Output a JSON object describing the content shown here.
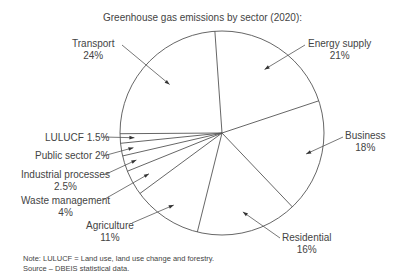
{
  "chart_data": {
    "type": "pie",
    "title": "Greenhouse gas emissions by sector (2020):",
    "categories": [
      "Energy supply",
      "Business",
      "Residential",
      "Agriculture",
      "Waste management",
      "Industrial processes",
      "Public sector",
      "LULUCF",
      "Transport"
    ],
    "values": [
      21,
      18,
      16,
      11,
      4,
      2.5,
      2,
      1.5,
      24
    ],
    "unit": "%",
    "start_angle_deg": -4,
    "direction": "clockwise",
    "legend": "none (callout labels)"
  },
  "labels": [
    {
      "name": "Energy supply",
      "pct": "21%"
    },
    {
      "name": "Business",
      "pct": "18%"
    },
    {
      "name": "Residential",
      "pct": "16%"
    },
    {
      "name": "Agriculture",
      "pct": "11%"
    },
    {
      "name": "Waste management",
      "pct": "4%"
    },
    {
      "name": "Industrial processes",
      "pct": "2.5%"
    },
    {
      "name": "Public sector 2%",
      "pct": ""
    },
    {
      "name": "LULUCF 1.5%",
      "pct": ""
    },
    {
      "name": "Transport",
      "pct": "24%"
    }
  ],
  "notes": {
    "line1": "Note: LULUCF = Land use, land use change and forestry.",
    "line2": "Source – DBEIS statistical data."
  }
}
